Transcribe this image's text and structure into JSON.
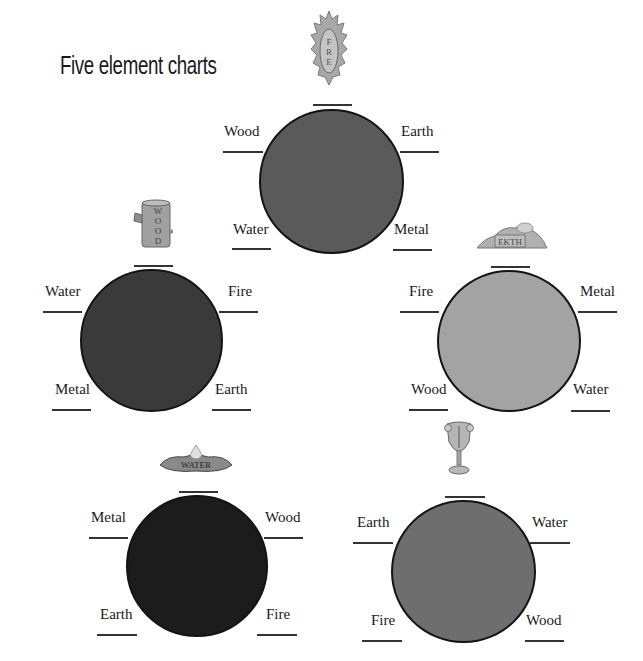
{
  "title": "Five element charts",
  "charts": [
    {
      "element": "Fire",
      "icon": "fire-flame-icon",
      "icon_text": "FIRE",
      "fill_color": "#5a5a5a",
      "labels": {
        "top_left": "Wood",
        "top_right": "Earth",
        "bottom_left": "Water",
        "bottom_right": "Metal"
      }
    },
    {
      "element": "Wood",
      "icon": "wood-log-icon",
      "icon_text": "WOOD",
      "fill_color": "#3a3a3a",
      "labels": {
        "top_left": "Water",
        "top_right": "Fire",
        "bottom_left": "Metal",
        "bottom_right": "Earth"
      }
    },
    {
      "element": "Earth",
      "icon": "earth-mound-icon",
      "icon_text": "EARTH",
      "fill_color": "#a3a3a3",
      "labels": {
        "top_left": "Fire",
        "top_right": "Metal",
        "bottom_left": "Wood",
        "bottom_right": "Water"
      }
    },
    {
      "element": "Water",
      "icon": "water-puddle-icon",
      "icon_text": "WATER",
      "fill_color": "#1c1c1c",
      "labels": {
        "top_left": "Metal",
        "top_right": "Wood",
        "bottom_left": "Earth",
        "bottom_right": "Fire"
      }
    },
    {
      "element": "Metal",
      "icon": "metal-goblet-icon",
      "icon_text": "METAL",
      "fill_color": "#6e6e6e",
      "labels": {
        "top_left": "Earth",
        "top_right": "Water",
        "bottom_left": "Fire",
        "bottom_right": "Wood"
      }
    }
  ]
}
